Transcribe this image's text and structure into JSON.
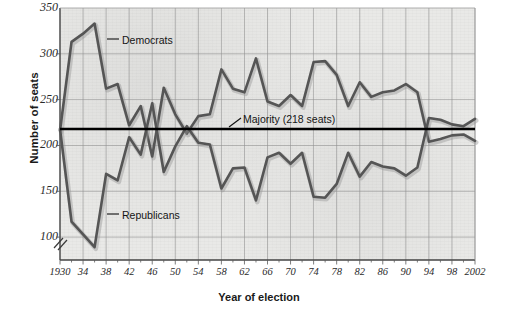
{
  "chart_data": {
    "type": "line",
    "title": "",
    "xlabel": "Year of election",
    "ylabel": "Number of seats",
    "xlim": [
      1930,
      2002
    ],
    "ylim": [
      75,
      350
    ],
    "y_axis_break": true,
    "grid": true,
    "legend_position": "inline-annotations",
    "y_ticks": [
      350,
      300,
      250,
      200,
      150,
      100
    ],
    "x_ticks": [
      "1930",
      "34",
      "38",
      "42",
      "46",
      "50",
      "54",
      "58",
      "62",
      "66",
      "70",
      "74",
      "78",
      "82",
      "86",
      "90",
      "94",
      "98",
      "2002"
    ],
    "x_tick_years": [
      1930,
      1934,
      1938,
      1942,
      1946,
      1950,
      1954,
      1958,
      1962,
      1966,
      1970,
      1974,
      1978,
      1982,
      1986,
      1990,
      1994,
      1998,
      2002
    ],
    "x": [
      1930,
      1932,
      1934,
      1936,
      1938,
      1940,
      1942,
      1944,
      1946,
      1948,
      1950,
      1952,
      1954,
      1956,
      1958,
      1960,
      1962,
      1964,
      1966,
      1968,
      1970,
      1972,
      1974,
      1976,
      1978,
      1980,
      1982,
      1984,
      1986,
      1988,
      1990,
      1992,
      1994,
      1996,
      1998,
      2000,
      2002
    ],
    "series": [
      {
        "name": "Democrats",
        "color": "#555555",
        "values": [
          216,
          313,
          322,
          333,
          262,
          267,
          222,
          243,
          188,
          263,
          234,
          213,
          232,
          234,
          283,
          262,
          258,
          295,
          248,
          243,
          255,
          243,
          291,
          292,
          277,
          243,
          269,
          253,
          258,
          260,
          267,
          258,
          204,
          207,
          211,
          212,
          205
        ]
      },
      {
        "name": "Republicans",
        "color": "#555555",
        "values": [
          218,
          117,
          103,
          89,
          169,
          162,
          209,
          190,
          246,
          171,
          199,
          221,
          203,
          201,
          153,
          175,
          176,
          140,
          187,
          192,
          180,
          192,
          144,
          143,
          158,
          192,
          166,
          182,
          177,
          175,
          167,
          176,
          230,
          228,
          223,
          221,
          229
        ]
      }
    ],
    "reference_line": {
      "label": "Majority (218 seats)",
      "value": 218,
      "color": "#000000"
    },
    "annotations": [
      {
        "label": "Democrats",
        "x_px": 122,
        "y_px": 34
      },
      {
        "label": "Republicans",
        "x_px": 122,
        "y_px": 209
      },
      {
        "label": "Majority (218 seats)",
        "x_px": 243,
        "y_px": 113
      }
    ]
  },
  "axes": {
    "y_title": "Number of seats",
    "x_title": "Year of election"
  },
  "colors": {
    "plot_background": "#e9e9e7",
    "grid": "#8f8f8f",
    "series": "#555555",
    "majority_line": "#000000",
    "text": "#1a1a1a"
  }
}
